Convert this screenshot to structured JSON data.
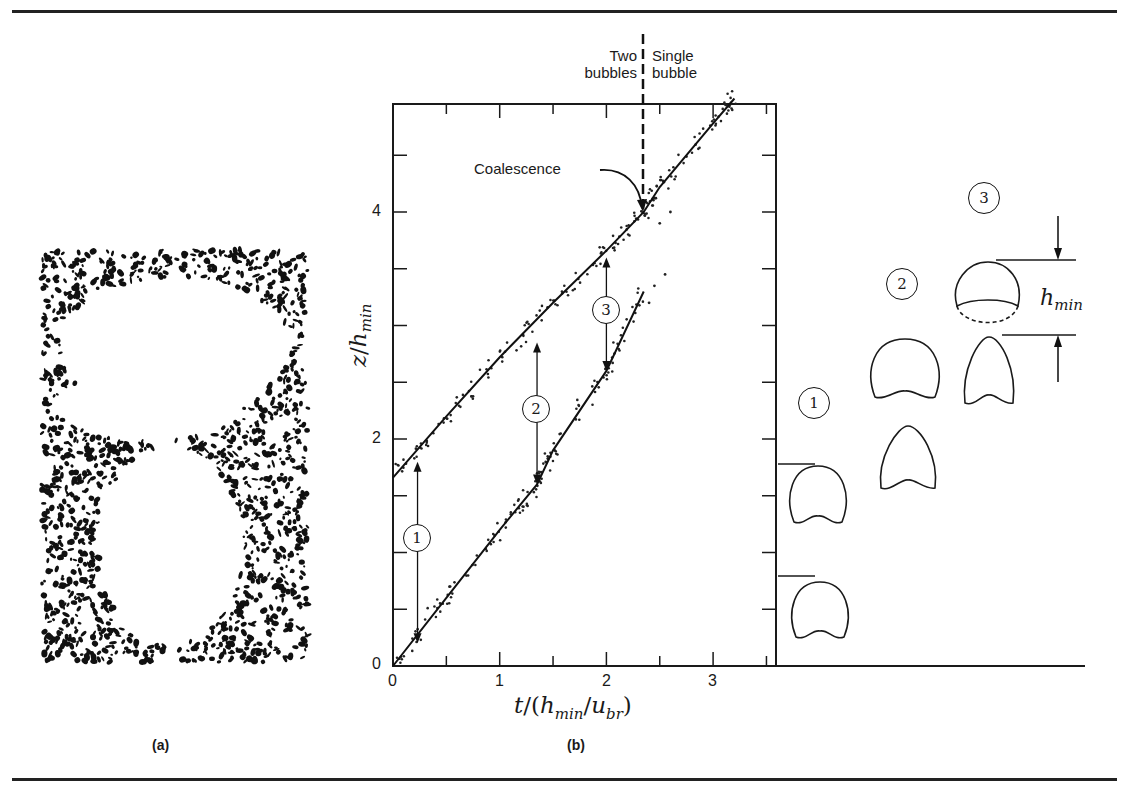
{
  "figure": {
    "panel_a": {
      "label": "(a)",
      "description": "Photograph of two bubbles in a fluidized bed, one trailing the other"
    },
    "panel_b": {
      "label": "(b)"
    },
    "region_labels": {
      "left_line1": "Two",
      "left_line2": "bubbles",
      "right_line1": "Single",
      "right_line2": "bubble"
    },
    "annotation": "Coalescence",
    "xaxis_label": "t/(h_min/u_br)",
    "yaxis_label": "z/h_min",
    "xaxis_label_parts": {
      "t": "t",
      "slash": "/(",
      "h": "h",
      "min": "min",
      "slash2": "/",
      "u": "u",
      "br": "br",
      "close": ")"
    },
    "yaxis_label_parts": {
      "z": "z",
      "slash": "/",
      "h": "h",
      "min": "min"
    },
    "circled_markers": [
      "1",
      "2",
      "3"
    ],
    "schematic": {
      "stage_labels": [
        "1",
        "2",
        "3"
      ],
      "dimension_label": "h_min",
      "dimension_parts": {
        "h": "h",
        "min": "min"
      }
    }
  },
  "chart_data": {
    "type": "line",
    "title": "",
    "xlabel": "t/(h_min/u_br)",
    "ylabel": "z/h_min",
    "xlim": [
      0,
      3.57
    ],
    "ylim": [
      0,
      4.95
    ],
    "xticks": [
      0,
      1,
      2,
      3
    ],
    "yticks": [
      0,
      2,
      4
    ],
    "minor_xtick_step": 0.5,
    "minor_ytick_step": 0.5,
    "grid": false,
    "series": [
      {
        "name": "Leading bubble",
        "x": [
          0,
          0.5,
          1.0,
          1.5,
          2.0,
          2.35,
          2.5,
          3.0,
          3.2
        ],
        "y": [
          1.66,
          2.2,
          2.72,
          3.2,
          3.66,
          4.0,
          4.22,
          4.78,
          5.0
        ]
      },
      {
        "name": "Trailing bubble",
        "x": [
          0,
          0.5,
          1.0,
          1.35,
          1.5,
          2.0,
          2.35
        ],
        "y": [
          0,
          0.6,
          1.2,
          1.6,
          1.9,
          2.6,
          3.3
        ]
      }
    ],
    "separations": [
      {
        "marker": "1",
        "t": 0.23,
        "z_lower": 0.2,
        "z_upper": 1.8
      },
      {
        "marker": "2",
        "t": 1.35,
        "z_lower": 1.6,
        "z_upper": 2.85
      },
      {
        "marker": "3",
        "t": 2.0,
        "z_lower": 2.6,
        "z_upper": 3.6
      }
    ],
    "coalescence_t": 2.35,
    "annotations": [
      "Coalescence",
      "Two bubbles",
      "Single bubble"
    ]
  }
}
